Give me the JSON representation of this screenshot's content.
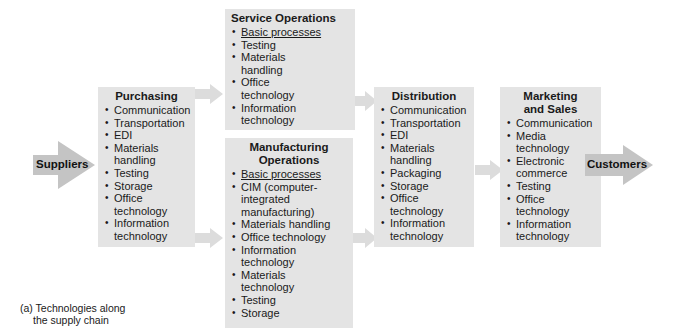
{
  "diagram": {
    "caption": [
      "(a) Technologies along",
      "the supply chain"
    ],
    "colors": {
      "box": "#e4e4e4",
      "arrow": "#c8c8c8",
      "thin_arrow": "#dcdcdc"
    },
    "endpoints": {
      "start": "Suppliers",
      "end": "Customers"
    },
    "stages": {
      "purchasing": {
        "title": "Purchasing",
        "items": [
          "Communication",
          "Transportation",
          "EDI",
          "Materials handling",
          "Testing",
          "Storage",
          "Office technology",
          "Information technology"
        ]
      },
      "service": {
        "title": "Service Operations",
        "items": [
          "Basic processes",
          "Testing",
          "Materials handling",
          "Office technology",
          "Information technology"
        ]
      },
      "manufacturing": {
        "title_line1": "Manufacturing",
        "title_line2": "Operations",
        "items": [
          "Basic processes",
          "CIM (computer-integrated manufacturing)",
          "Materials handling",
          "Office technology",
          "Information technology",
          "Materials technology",
          "Testing",
          "Storage"
        ]
      },
      "distribution": {
        "title": "Distribution",
        "items": [
          "Communication",
          "Transportation",
          "EDI",
          "Materials handling",
          "Packaging",
          "Storage",
          "Office technology",
          "Information technology"
        ]
      },
      "marketing": {
        "title_line1": "Marketing",
        "title_line2": "and Sales",
        "items": [
          "Communication",
          "Media technology",
          "Electronic commerce",
          "Testing",
          "Office technology",
          "Information technology"
        ]
      }
    }
  }
}
